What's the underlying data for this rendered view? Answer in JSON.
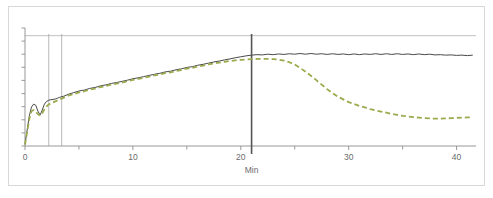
{
  "figure": {
    "background_color": "#ffffff",
    "frame_color": "#d8d8d8"
  },
  "chart_data": {
    "type": "line",
    "title": "",
    "subtitle": "",
    "xlabel": "Min",
    "ylabel": "",
    "xlim": [
      0,
      41.8
    ],
    "ylim": [
      0,
      10
    ],
    "grid": false,
    "legend": "none",
    "x_ticks_major": [
      0,
      10,
      20,
      30,
      40
    ],
    "x_tick_labels": [
      "0",
      "10",
      "20",
      "30",
      "40"
    ],
    "x_ticks_minor": [
      5,
      15,
      25,
      35
    ],
    "y_ticks": [
      0,
      1.11,
      2.22,
      3.33,
      4.44,
      5.56,
      6.67,
      7.78,
      8.89,
      10
    ],
    "y_tick_labels": [
      "",
      "",
      "",
      "",
      "",
      "",
      "",
      "",
      "",
      ""
    ],
    "annotations": {
      "marker_lines": [
        {
          "name": "event-line-1",
          "x": 2.2,
          "color": "#a8a8a8",
          "width": 0.8,
          "style": "solid"
        },
        {
          "name": "event-line-2",
          "x": 3.4,
          "color": "#a8a8a8",
          "width": 0.8,
          "style": "solid"
        },
        {
          "name": "endpoint-marker-line",
          "x": 21.0,
          "color": "#555555",
          "width": 1.6,
          "style": "solid"
        }
      ],
      "reference_line_top": {
        "name": "upper-reference-line",
        "y": 9.35,
        "color": "#b0b0b0",
        "width": 0.8
      }
    },
    "series": [
      {
        "name": "solid-trace",
        "label": "",
        "color": "#4a4a4a",
        "style": "solid",
        "width": 1.0,
        "x": [
          0,
          0.2,
          0.4,
          0.6,
          0.8,
          1.0,
          1.2,
          1.4,
          1.6,
          1.8,
          2.0,
          2.2,
          2.4,
          2.6,
          2.8,
          3.0,
          3.2,
          3.4,
          3.6,
          3.8,
          4.0,
          4.5,
          5.0,
          5.5,
          6.0,
          6.5,
          7.0,
          7.5,
          8.0,
          8.5,
          9.0,
          9.5,
          10.0,
          10.5,
          11.0,
          11.5,
          12.0,
          12.5,
          13.0,
          13.5,
          14.0,
          14.5,
          15.0,
          15.5,
          16.0,
          16.5,
          17.0,
          17.5,
          18.0,
          18.5,
          19.0,
          19.5,
          20.0,
          20.5,
          21.0,
          21.5,
          22.0,
          22.5,
          23.0,
          23.5,
          24.0,
          24.5,
          25.0,
          25.5,
          26.0,
          26.5,
          27.0,
          27.5,
          28.0,
          28.5,
          29.0,
          29.5,
          30.0,
          30.5,
          31.0,
          31.5,
          32.0,
          32.5,
          33.0,
          33.5,
          34.0,
          34.5,
          35.0,
          35.5,
          36.0,
          36.5,
          37.0,
          37.5,
          38.0,
          38.5,
          39.0,
          39.5,
          40.0,
          40.5,
          41.0,
          41.5
        ],
        "y": [
          0.15,
          1.35,
          2.55,
          3.3,
          3.55,
          3.45,
          2.95,
          2.62,
          3.05,
          3.55,
          3.78,
          3.88,
          3.92,
          3.95,
          3.98,
          4.05,
          4.12,
          4.18,
          4.22,
          4.3,
          4.38,
          4.52,
          4.66,
          4.74,
          4.88,
          4.96,
          5.1,
          5.18,
          5.3,
          5.38,
          5.48,
          5.58,
          5.7,
          5.78,
          5.88,
          5.98,
          6.08,
          6.16,
          6.28,
          6.34,
          6.46,
          6.54,
          6.66,
          6.72,
          6.84,
          6.92,
          7.02,
          7.12,
          7.2,
          7.3,
          7.38,
          7.48,
          7.56,
          7.64,
          7.7,
          7.74,
          7.72,
          7.78,
          7.74,
          7.8,
          7.76,
          7.82,
          7.78,
          7.84,
          7.78,
          7.84,
          7.78,
          7.82,
          7.76,
          7.82,
          7.76,
          7.8,
          7.74,
          7.8,
          7.74,
          7.8,
          7.76,
          7.82,
          7.76,
          7.82,
          7.76,
          7.82,
          7.76,
          7.8,
          7.74,
          7.8,
          7.74,
          7.78,
          7.72,
          7.74,
          7.7,
          7.72,
          7.68,
          7.7,
          7.66,
          7.7
        ]
      },
      {
        "name": "dashed-trace",
        "label": "",
        "color": "#9aab4c",
        "style": "dashed",
        "width": 1.8,
        "dash": "5 3",
        "x": [
          0,
          0.2,
          0.4,
          0.6,
          0.8,
          1.0,
          1.2,
          1.4,
          1.6,
          1.8,
          2.0,
          2.2,
          2.4,
          2.6,
          2.8,
          3.0,
          3.2,
          3.4,
          3.6,
          3.8,
          4.0,
          4.5,
          5.0,
          5.5,
          6.0,
          6.5,
          7.0,
          7.5,
          8.0,
          8.5,
          9.0,
          9.5,
          10.0,
          10.5,
          11.0,
          11.5,
          12.0,
          12.5,
          13.0,
          13.5,
          14.0,
          14.5,
          15.0,
          15.5,
          16.0,
          16.5,
          17.0,
          17.5,
          18.0,
          18.5,
          19.0,
          19.5,
          20.0,
          20.5,
          21.0,
          21.5,
          22.0,
          22.5,
          23.0,
          23.5,
          24.0,
          24.5,
          25.0,
          25.5,
          26.0,
          26.5,
          27.0,
          27.5,
          28.0,
          28.5,
          29.0,
          29.5,
          30.0,
          30.5,
          31.0,
          31.5,
          32.0,
          32.5,
          33.0,
          33.5,
          34.0,
          34.5,
          35.0,
          35.5,
          36.0,
          36.5,
          37.0,
          37.5,
          38.0,
          38.5,
          39.0,
          39.5,
          40.0,
          40.5,
          41.0,
          41.5
        ],
        "y": [
          0.12,
          1.2,
          2.3,
          2.95,
          3.05,
          2.9,
          2.7,
          2.58,
          2.78,
          3.1,
          3.35,
          3.52,
          3.62,
          3.7,
          3.78,
          3.86,
          3.94,
          4.02,
          4.1,
          4.18,
          4.26,
          4.4,
          4.54,
          4.64,
          4.78,
          4.86,
          5.0,
          5.08,
          5.2,
          5.28,
          5.38,
          5.48,
          5.6,
          5.68,
          5.78,
          5.88,
          5.98,
          6.06,
          6.18,
          6.24,
          6.36,
          6.44,
          6.56,
          6.62,
          6.74,
          6.82,
          6.92,
          7.0,
          7.06,
          7.14,
          7.2,
          7.26,
          7.3,
          7.34,
          7.36,
          7.38,
          7.38,
          7.38,
          7.36,
          7.32,
          7.24,
          7.1,
          6.9,
          6.62,
          6.3,
          5.95,
          5.58,
          5.2,
          4.82,
          4.48,
          4.18,
          3.95,
          3.72,
          3.55,
          3.4,
          3.28,
          3.12,
          3.02,
          2.92,
          2.82,
          2.72,
          2.64,
          2.56,
          2.5,
          2.44,
          2.4,
          2.36,
          2.34,
          2.32,
          2.32,
          2.34,
          2.36,
          2.38,
          2.4,
          2.42,
          2.44
        ]
      }
    ]
  }
}
